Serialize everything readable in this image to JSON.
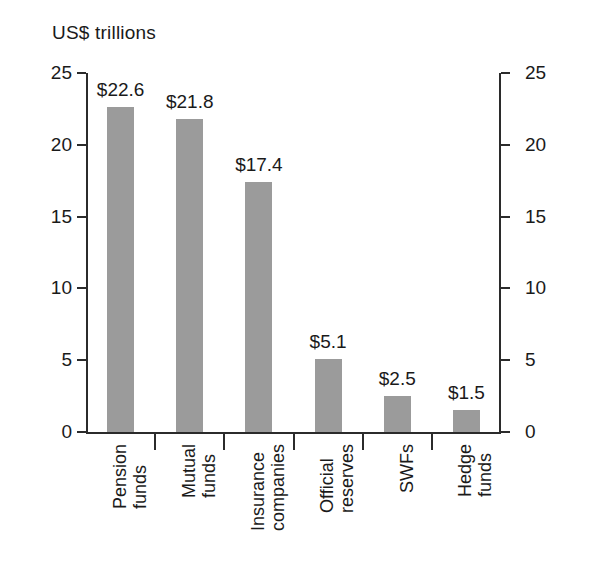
{
  "chart_data": {
    "type": "bar",
    "title": "US$ trillions",
    "xlabel": "",
    "ylabel": "",
    "ylim": [
      0,
      25
    ],
    "yticks": [
      0,
      5,
      10,
      15,
      20,
      25
    ],
    "ytick_labels": [
      "0",
      "5",
      "10",
      "15",
      "20",
      "25"
    ],
    "right_axis": true,
    "right_ytick_labels": [
      "0",
      "5",
      "10",
      "15",
      "20",
      "25"
    ],
    "grid": false,
    "legend": null,
    "bar_color": "#9b9b9b",
    "categories": [
      "Pension funds",
      "Mutual funds",
      "Insurance companies",
      "Official reserves",
      "SWFs",
      "Hedge funds"
    ],
    "category_lines": [
      [
        "Pension",
        "funds"
      ],
      [
        "Mutual",
        "funds"
      ],
      [
        "Insurance",
        "companies"
      ],
      [
        "Official",
        "reserves"
      ],
      [
        "SWFs"
      ],
      [
        "Hedge",
        "funds"
      ]
    ],
    "values": [
      22.6,
      21.8,
      17.4,
      5.1,
      2.5,
      1.5
    ],
    "value_labels": [
      "$22.6",
      "$21.8",
      "$17.4",
      "$5.1",
      "$2.5",
      "$1.5"
    ]
  }
}
